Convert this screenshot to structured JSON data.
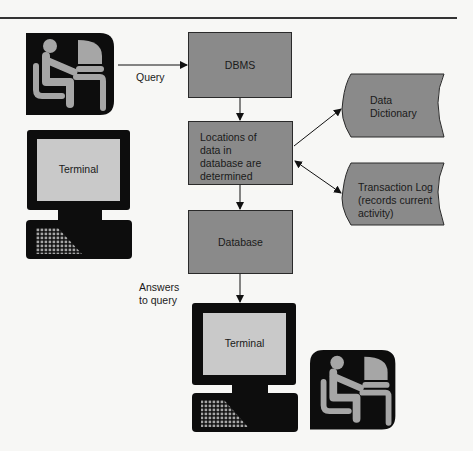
{
  "diagram": {
    "type": "flow",
    "edges": [
      {
        "from": "user_top",
        "to": "dbms",
        "label": "Query"
      },
      {
        "from": "dbms",
        "to": "locations"
      },
      {
        "from": "locations",
        "to": "data_dictionary"
      },
      {
        "from": "locations",
        "to": "transaction_log",
        "bidirectional": true
      },
      {
        "from": "locations",
        "to": "database"
      },
      {
        "from": "database",
        "to": "terminal_bottom",
        "label": "Answers to query"
      }
    ]
  },
  "nodes": {
    "dbms": "DBMS",
    "locations": [
      "Locations of",
      "data in",
      "database are",
      "determined"
    ],
    "database": "Database",
    "data_dictionary": [
      "Data",
      "Dictionary"
    ],
    "transaction_log": [
      "Transaction Log",
      "(records current",
      "activity)"
    ],
    "terminal_left": "Terminal",
    "terminal_bottom": "Terminal"
  },
  "labels": {
    "query": "Query",
    "answers": [
      "Answers",
      "to query"
    ]
  },
  "colors": {
    "box_fill": "#8a8a8a",
    "screen_fill": "#c9c9c9",
    "icon_dark": "#0d0d0d",
    "icon_figure": "#a6a6a6",
    "background": "#f7f7f5"
  }
}
